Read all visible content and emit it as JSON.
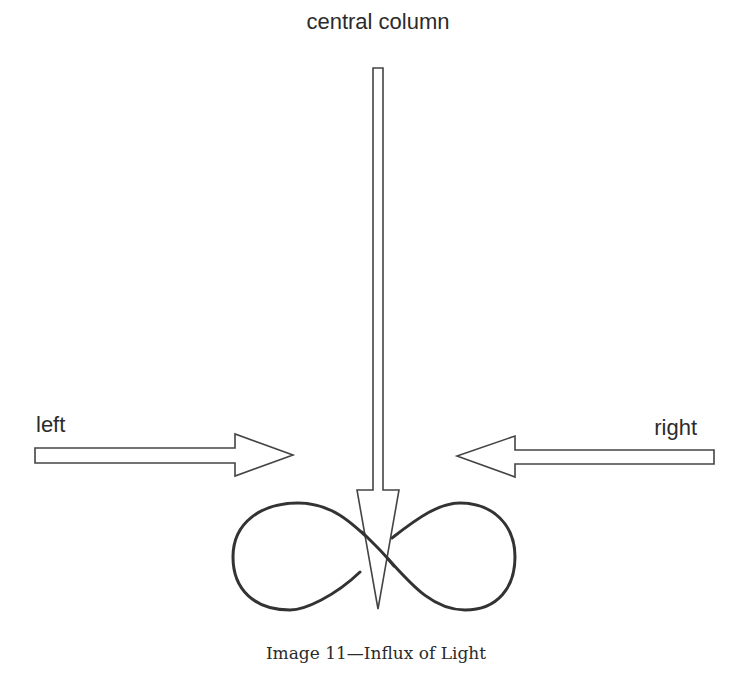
{
  "diagram": {
    "labels": {
      "central_column": "central column",
      "left": "left",
      "right": "right"
    },
    "caption": "Image 11—Influx of Light",
    "elements": [
      {
        "name": "central-column-arrow",
        "direction": "down"
      },
      {
        "name": "left-arrow",
        "direction": "right"
      },
      {
        "name": "right-arrow",
        "direction": "left"
      },
      {
        "name": "infinity-loop",
        "shape": "figure-eight"
      }
    ],
    "colors": {
      "stroke": "#333333",
      "text": "#2b2b2b",
      "background": "#ffffff"
    }
  }
}
